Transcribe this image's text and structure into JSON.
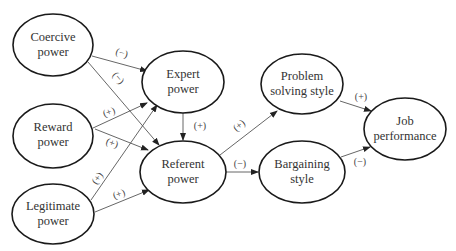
{
  "diagram": {
    "nodes": [
      {
        "id": "coercive",
        "line1": "Coercive",
        "line2": "power"
      },
      {
        "id": "reward",
        "line1": "Reward",
        "line2": "power"
      },
      {
        "id": "legitimate",
        "line1": "Legitimate",
        "line2": "power"
      },
      {
        "id": "expert",
        "line1": "Expert",
        "line2": "power"
      },
      {
        "id": "referent",
        "line1": "Referent",
        "line2": "power"
      },
      {
        "id": "problem",
        "line1": "Problem",
        "line2": "solving style"
      },
      {
        "id": "bargaining",
        "line1": "Bargaining",
        "line2": "style"
      },
      {
        "id": "job",
        "line1": "Job",
        "line2": "performance"
      }
    ],
    "edges": [
      {
        "from": "coercive",
        "to": "expert",
        "label": "(−)"
      },
      {
        "from": "coercive",
        "to": "referent",
        "label": "(−)"
      },
      {
        "from": "reward",
        "to": "expert",
        "label": "(+)"
      },
      {
        "from": "reward",
        "to": "referent",
        "label": "(+)"
      },
      {
        "from": "legitimate",
        "to": "expert",
        "label": "(+)"
      },
      {
        "from": "legitimate",
        "to": "referent",
        "label": "(+)"
      },
      {
        "from": "expert",
        "to": "referent",
        "label": "(+)"
      },
      {
        "from": "referent",
        "to": "problem",
        "label": "(+)"
      },
      {
        "from": "referent",
        "to": "bargaining",
        "label": "(−)"
      },
      {
        "from": "problem",
        "to": "job",
        "label": "(+)"
      },
      {
        "from": "bargaining",
        "to": "job",
        "label": "(−)"
      }
    ]
  }
}
